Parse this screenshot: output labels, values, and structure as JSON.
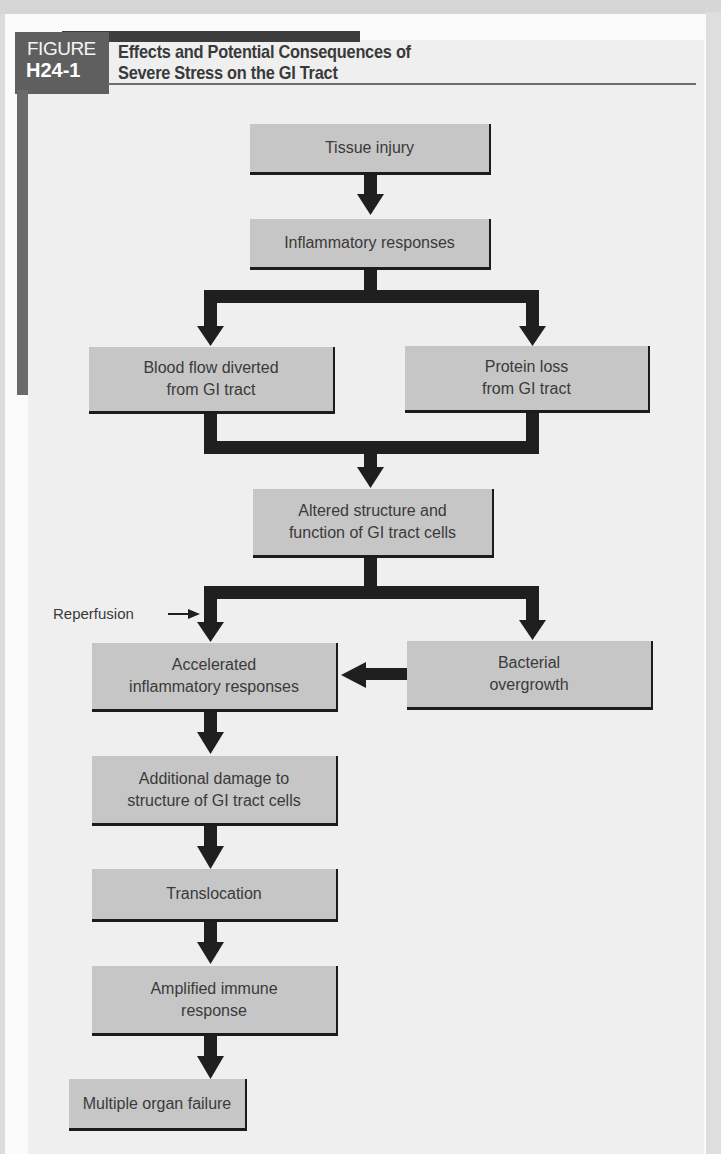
{
  "figure": {
    "label_word": "FIGURE",
    "label_number": "H24-1",
    "title_line1": "Effects and Potential Consequences of",
    "title_line2": "Severe Stress on the GI Tract"
  },
  "colors": {
    "box_fill": "#c6c6c6",
    "box_border": "#1c1c1c",
    "arrow": "#1f1f1f",
    "panel": "#efefef",
    "figure_tag": "#5f5f5f",
    "text": "#3a3a3a"
  },
  "nodes": [
    {
      "id": "tissue-injury",
      "label": "Tissue injury"
    },
    {
      "id": "inflammatory-responses",
      "label": "Inflammatory responses"
    },
    {
      "id": "blood-flow-diverted",
      "line1": "Blood flow diverted",
      "line2": "from GI tract"
    },
    {
      "id": "protein-loss",
      "line1": "Protein loss",
      "line2": "from GI tract"
    },
    {
      "id": "altered-structure",
      "line1": "Altered structure and",
      "line2": "function of GI tract cells"
    },
    {
      "id": "accelerated-inflammatory",
      "line1": "Accelerated",
      "line2": "inflammatory responses"
    },
    {
      "id": "bacterial-overgrowth",
      "line1": "Bacterial",
      "line2": "overgrowth"
    },
    {
      "id": "additional-damage",
      "line1": "Additional damage to",
      "line2": "structure of GI tract cells"
    },
    {
      "id": "translocation",
      "label": "Translocation"
    },
    {
      "id": "amplified-immune",
      "line1": "Amplified immune",
      "line2": "response"
    },
    {
      "id": "multiple-organ-failure",
      "label": "Multiple organ failure"
    }
  ],
  "annotations": {
    "reperfusion": "Reperfusion"
  },
  "edges": [
    [
      "tissue-injury",
      "inflammatory-responses"
    ],
    [
      "inflammatory-responses",
      "blood-flow-diverted"
    ],
    [
      "inflammatory-responses",
      "protein-loss"
    ],
    [
      "blood-flow-diverted",
      "altered-structure"
    ],
    [
      "protein-loss",
      "altered-structure"
    ],
    [
      "altered-structure",
      "accelerated-inflammatory"
    ],
    [
      "altered-structure",
      "bacterial-overgrowth"
    ],
    [
      "bacterial-overgrowth",
      "accelerated-inflammatory"
    ],
    [
      "accelerated-inflammatory",
      "additional-damage"
    ],
    [
      "additional-damage",
      "translocation"
    ],
    [
      "translocation",
      "amplified-immune"
    ],
    [
      "amplified-immune",
      "multiple-organ-failure"
    ]
  ]
}
